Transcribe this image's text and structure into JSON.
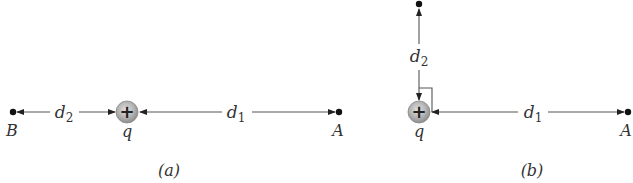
{
  "figure": {
    "panels": [
      {
        "caption": "(a)",
        "charge": {
          "label": "q",
          "sign": "+"
        },
        "points": [
          {
            "label": "B",
            "distance_label": "d",
            "distance_sub": "2"
          },
          {
            "label": "A",
            "distance_label": "d",
            "distance_sub": "1"
          }
        ]
      },
      {
        "caption": "(b)",
        "charge": {
          "label": "q",
          "sign": "+"
        },
        "points": [
          {
            "label": "",
            "distance_label": "d",
            "distance_sub": "2"
          },
          {
            "label": "A",
            "distance_label": "d",
            "distance_sub": "1"
          }
        ],
        "right_angle_marker": true
      }
    ],
    "colors": {
      "line": "#555555",
      "dot": "#111111",
      "charge_fill": "#b0b0b0",
      "charge_edge": "#8a8a8a",
      "text": "#333333"
    }
  }
}
